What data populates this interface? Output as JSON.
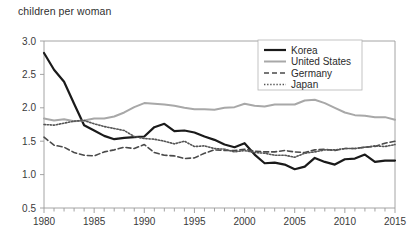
{
  "chart_data": {
    "type": "line",
    "title": "children per woman",
    "xlabel": "",
    "ylabel": "children per woman",
    "xlim": [
      1980,
      2015
    ],
    "ylim": [
      0.5,
      3.0
    ],
    "ytick_labels": [
      "3.0",
      "2.5",
      "2.0",
      "1.5",
      "1.0",
      "0.5"
    ],
    "ytick_values": [
      3.0,
      2.5,
      2.0,
      1.5,
      1.0,
      0.5
    ],
    "xtick_labels": [
      "1980",
      "1985",
      "1990",
      "1995",
      "2000",
      "2005",
      "2010",
      "2015"
    ],
    "xtick_values": [
      1980,
      1985,
      1990,
      1995,
      2000,
      2005,
      2010,
      2015
    ],
    "minor_xticks": "every year",
    "grid": false,
    "legend_position": "top-right",
    "x": [
      1980,
      1981,
      1982,
      1983,
      1984,
      1985,
      1986,
      1987,
      1988,
      1989,
      1990,
      1991,
      1992,
      1993,
      1994,
      1995,
      1996,
      1997,
      1998,
      1999,
      2000,
      2001,
      2002,
      2003,
      2004,
      2005,
      2006,
      2007,
      2008,
      2009,
      2010,
      2011,
      2012,
      2013,
      2014,
      2015
    ],
    "series": [
      {
        "name": "Korea",
        "color": "#1a1a1a",
        "style": "solid",
        "width": 2.2,
        "values": [
          2.82,
          2.57,
          2.39,
          2.06,
          1.74,
          1.66,
          1.58,
          1.53,
          1.55,
          1.56,
          1.57,
          1.71,
          1.76,
          1.65,
          1.66,
          1.63,
          1.57,
          1.52,
          1.45,
          1.41,
          1.47,
          1.3,
          1.17,
          1.18,
          1.15,
          1.08,
          1.12,
          1.25,
          1.19,
          1.15,
          1.23,
          1.24,
          1.3,
          1.19,
          1.21,
          1.21
        ]
      },
      {
        "name": "United States",
        "color": "#a8a8a8",
        "style": "solid",
        "width": 2.0,
        "values": [
          1.84,
          1.81,
          1.83,
          1.8,
          1.81,
          1.84,
          1.84,
          1.87,
          1.93,
          2.01,
          2.07,
          2.06,
          2.05,
          2.03,
          2.0,
          1.98,
          1.98,
          1.97,
          2.0,
          2.01,
          2.06,
          2.03,
          2.02,
          2.05,
          2.05,
          2.05,
          2.11,
          2.12,
          2.07,
          2.0,
          1.93,
          1.89,
          1.88,
          1.86,
          1.86,
          1.82
        ]
      },
      {
        "name": "Germany",
        "color": "#4a4a4a",
        "style": "dashed",
        "width": 1.6,
        "values": [
          1.56,
          1.44,
          1.41,
          1.33,
          1.29,
          1.28,
          1.34,
          1.37,
          1.41,
          1.39,
          1.45,
          1.33,
          1.29,
          1.28,
          1.24,
          1.25,
          1.32,
          1.37,
          1.36,
          1.36,
          1.38,
          1.35,
          1.34,
          1.34,
          1.36,
          1.34,
          1.33,
          1.37,
          1.38,
          1.36,
          1.39,
          1.39,
          1.41,
          1.42,
          1.47,
          1.5
        ]
      },
      {
        "name": "Japan",
        "color": "#555555",
        "style": "dotted",
        "width": 1.6,
        "values": [
          1.75,
          1.74,
          1.77,
          1.8,
          1.81,
          1.76,
          1.72,
          1.69,
          1.66,
          1.57,
          1.54,
          1.53,
          1.5,
          1.46,
          1.5,
          1.42,
          1.43,
          1.39,
          1.38,
          1.34,
          1.36,
          1.33,
          1.32,
          1.29,
          1.29,
          1.26,
          1.32,
          1.34,
          1.37,
          1.37,
          1.39,
          1.39,
          1.41,
          1.43,
          1.42,
          1.45
        ]
      }
    ]
  },
  "legend": {
    "items": [
      {
        "label": "Korea"
      },
      {
        "label": "United States"
      },
      {
        "label": "Germany"
      },
      {
        "label": "Japan"
      }
    ]
  }
}
